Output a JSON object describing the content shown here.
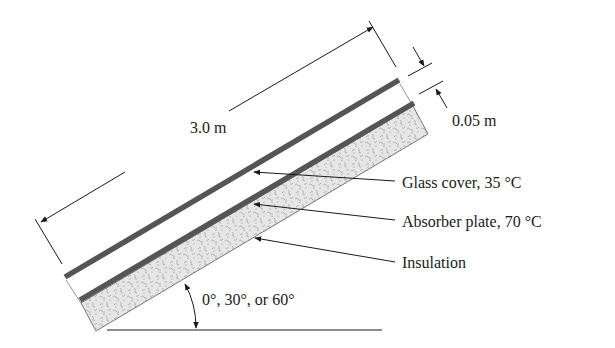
{
  "figure": {
    "type": "inclined flat-plate solar collector cross-section",
    "length_label": "3.0 m",
    "gap_label": "0.05 m",
    "angle_label": "0°, 30°, or 60°",
    "callouts": [
      {
        "id": "glass-cover",
        "label": "Glass cover, 35 °C"
      },
      {
        "id": "absorber-plate",
        "label": "Absorber plate, 70 °C"
      },
      {
        "id": "insulation",
        "label": "Insulation"
      }
    ]
  },
  "colors": {
    "line": "#1a1a1a",
    "plate": "#555555",
    "insulation_fill": "#e4e4e4",
    "insulation_speckle": "#9a9a9a"
  }
}
